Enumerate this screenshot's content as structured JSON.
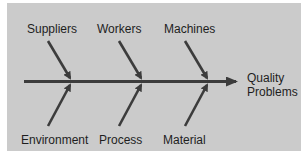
{
  "diagram": {
    "type": "fishbone",
    "effect": {
      "line1": "Quality",
      "line2": "Problems"
    },
    "causes_top": [
      {
        "label": "Suppliers"
      },
      {
        "label": "Workers"
      },
      {
        "label": "Machines"
      }
    ],
    "causes_bottom": [
      {
        "label": "Environment"
      },
      {
        "label": "Process"
      },
      {
        "label": "Material"
      }
    ],
    "colors": {
      "panel": "#cbcbcb",
      "arrow": "#3c3c3c",
      "text": "#1e1e1e"
    }
  }
}
